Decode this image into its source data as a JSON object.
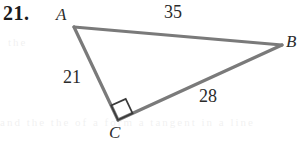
{
  "figure": {
    "problem_number": "21.",
    "type": "right-triangle",
    "stroke_color": "#7a7a7a",
    "mark_color": "#3a3a3a",
    "background_color": "#ffffff",
    "vertices": [
      {
        "name": "A",
        "label": "A",
        "x": 74,
        "y": 27
      },
      {
        "name": "B",
        "label": "B",
        "x": 282,
        "y": 45
      },
      {
        "name": "C",
        "label": "C",
        "x": 118,
        "y": 120
      }
    ],
    "sides": [
      {
        "name": "AB",
        "label": "35",
        "from": "A",
        "to": "B"
      },
      {
        "name": "AC",
        "label": "21",
        "from": "A",
        "to": "C"
      },
      {
        "name": "CB",
        "label": "28",
        "from": "C",
        "to": "B"
      }
    ],
    "right_angle": {
      "at_vertex": "C",
      "marker": "right-angle-square",
      "size": 16
    },
    "ghost_text": {
      "bottom": "and the the of a form a tangent in a line",
      "top": "the"
    }
  }
}
